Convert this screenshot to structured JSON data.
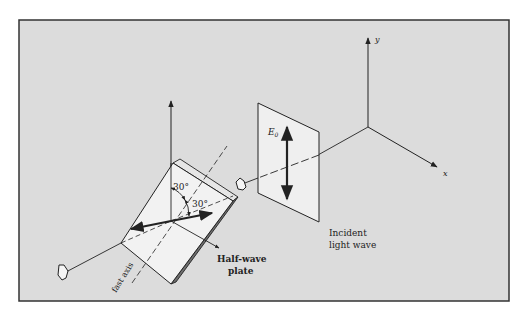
{
  "figure": {
    "colors": {
      "frame_background": "#dcdcdc",
      "frame_border": "#333333",
      "plate_face": "#f2f2f2",
      "plate_edge": "#6e6e6e",
      "line": "#222222"
    }
  },
  "labels": {
    "y_axis": "y",
    "x_axis": "x",
    "field": "E",
    "field_subscript": "0",
    "angle_1": "30°",
    "angle_2": "30°",
    "half_wave_line1": "Half-wave",
    "half_wave_line2": "plate",
    "incident_line1": "Incident",
    "incident_line2": "light wave",
    "fast_axis": "fast axis"
  }
}
